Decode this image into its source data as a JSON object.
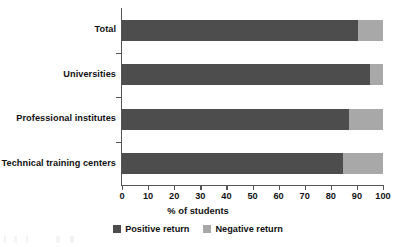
{
  "chart_data": {
    "type": "bar",
    "orientation": "horizontal",
    "stacked": true,
    "stack_total": 100,
    "title": "",
    "xlabel": "% of students",
    "ylabel": "",
    "xlim": [
      0,
      100
    ],
    "xticks": [
      0,
      10,
      20,
      30,
      40,
      50,
      60,
      70,
      80,
      90,
      100
    ],
    "xtick_labels": [
      "0",
      "10",
      "20",
      "30",
      "40",
      "50",
      "60",
      "70",
      "80",
      "90",
      "100"
    ],
    "grid": false,
    "legend_position": "bottom-center",
    "categories": [
      "Total",
      "Universities",
      "Professional institutes",
      "Technical training centers"
    ],
    "series": [
      {
        "name": "Positive return",
        "color": "#4d4d4d",
        "values": [
          90.5,
          95.0,
          87.0,
          84.5
        ]
      },
      {
        "name": "Negative return",
        "color": "#a8a8a8",
        "values": [
          9.5,
          5.0,
          13.0,
          15.5
        ]
      }
    ]
  },
  "legend": {
    "items": [
      {
        "label": "Positive return",
        "color": "#4d4d4d"
      },
      {
        "label": "Negative return",
        "color": "#a8a8a8"
      }
    ]
  },
  "axis": {
    "x_title": "% of students"
  },
  "colors": {
    "positive": "#4d4d4d",
    "negative": "#a8a8a8",
    "axis": "#555555",
    "text": "#121212",
    "background": "#ffffff"
  }
}
